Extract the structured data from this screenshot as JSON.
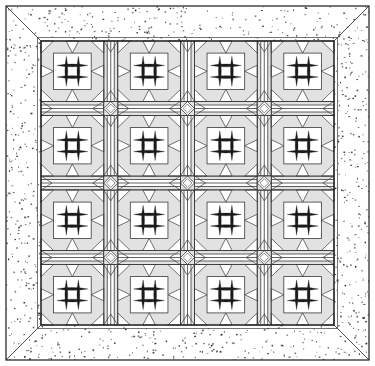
{
  "illustration": {
    "title": "Quilt block layout diagram",
    "type": "quilt-pattern-diagram",
    "canvas": {
      "width": 375,
      "height": 366
    },
    "colors": {
      "ink": "#1a1a1a",
      "line": "#3a3a3a",
      "paper": "#ffffff",
      "light_shade": "#e2e2e2",
      "mid_shade": "#d0d0d0",
      "pale_shade": "#efefef",
      "stipple_dot": "#2b2b2b"
    },
    "outer_frame": {
      "name": "quilt-outline",
      "x": 6,
      "y": 6,
      "width": 363,
      "height": 354,
      "stroke_width": 1.2
    },
    "border": {
      "name": "stippled-outer-border",
      "label": "stippled border",
      "thickness": 35,
      "mitered_corners": true,
      "fill_pattern": "stipple-dots",
      "dot_count": 2600,
      "dot_size_min": 0.7,
      "dot_size_max": 1.9
    },
    "inner_field": {
      "name": "quilt-center-field",
      "x": 41,
      "y": 41,
      "width": 293,
      "height": 284
    },
    "grid": {
      "rows": 4,
      "columns": 4,
      "block_label": "nine-patch star block",
      "sashing_label": "pieced sashing strip",
      "cornerstone_label": "square-in-square cornerstone"
    },
    "blocks": [
      {
        "row": 0,
        "col": 0,
        "name": "block-r0c0",
        "kind": "hash-star"
      },
      {
        "row": 0,
        "col": 1,
        "name": "block-r0c1",
        "kind": "hash-star"
      },
      {
        "row": 0,
        "col": 2,
        "name": "block-r0c2",
        "kind": "hash-star"
      },
      {
        "row": 0,
        "col": 3,
        "name": "block-r0c3",
        "kind": "hash-star"
      },
      {
        "row": 1,
        "col": 0,
        "name": "block-r1c0",
        "kind": "hash-star"
      },
      {
        "row": 1,
        "col": 1,
        "name": "block-r1c1",
        "kind": "hash-star"
      },
      {
        "row": 1,
        "col": 2,
        "name": "block-r1c2",
        "kind": "hash-star"
      },
      {
        "row": 1,
        "col": 3,
        "name": "block-r1c3",
        "kind": "hash-star"
      },
      {
        "row": 2,
        "col": 0,
        "name": "block-r2c0",
        "kind": "hash-star"
      },
      {
        "row": 2,
        "col": 1,
        "name": "block-r2c1",
        "kind": "hash-star"
      },
      {
        "row": 2,
        "col": 2,
        "name": "block-r2c2",
        "kind": "hash-star"
      },
      {
        "row": 2,
        "col": 3,
        "name": "block-r2c3",
        "kind": "hash-star"
      },
      {
        "row": 3,
        "col": 0,
        "name": "block-r3c0",
        "kind": "hash-star"
      },
      {
        "row": 3,
        "col": 1,
        "name": "block-r3c1",
        "kind": "hash-star"
      },
      {
        "row": 3,
        "col": 2,
        "name": "block-r3c2",
        "kind": "hash-star"
      },
      {
        "row": 3,
        "col": 3,
        "name": "block-r3c3",
        "kind": "hash-star"
      }
    ],
    "block_detail": {
      "center_grid": {
        "name": "hash-grid",
        "horizontal_bars": 2,
        "vertical_bars": 2,
        "bar_color": "#1a1a1a",
        "bar_shape": "tapered-lens"
      },
      "corner_units": 4,
      "corner_unit_kind": "half-square-triangle",
      "side_strips": 4
    },
    "cornerstones": {
      "count": 9,
      "kind": "diamond-in-square",
      "rows": 3,
      "columns": 3
    }
  }
}
